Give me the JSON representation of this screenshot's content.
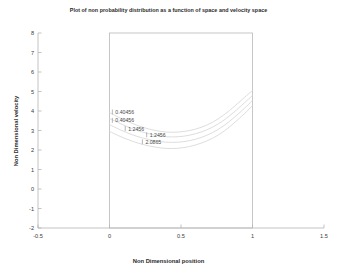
{
  "chart_data": {
    "type": "line",
    "title": "Plot of non probability distribution as a function of space and velocity space",
    "xlabel": "Non Dimensional position",
    "ylabel": "Non Dimensional velocity",
    "xlim": [
      -0.5,
      1.5
    ],
    "ylim": [
      -2,
      8
    ],
    "xticks": [
      "-0.5",
      "0",
      "0.5",
      "1",
      "1.5"
    ],
    "xtick_values": [
      -0.5,
      0,
      0.5,
      1,
      1.5
    ],
    "yticks": [
      "8",
      "7",
      "6",
      "5",
      "4",
      "3",
      "2",
      "1",
      "0",
      "-1",
      "-2"
    ],
    "ytick_values": [
      8,
      7,
      6,
      5,
      4,
      3,
      2,
      1,
      0,
      -1,
      -2
    ],
    "grid": false,
    "legend": "none",
    "data_box": {
      "x_range": [
        0,
        1
      ],
      "y_range": [
        -2,
        8
      ]
    },
    "series": [
      {
        "name": "0.40456",
        "level": 0.40456,
        "x": [
          0.0,
          0.08,
          0.16,
          0.24,
          0.32,
          0.4,
          0.48,
          0.56,
          0.64,
          0.72,
          0.8,
          0.88,
          0.96,
          1.0
        ],
        "y": [
          3.92,
          3.62,
          3.36,
          3.15,
          3.0,
          2.92,
          2.92,
          3.0,
          3.16,
          3.42,
          3.8,
          4.28,
          4.8,
          5.05
        ]
      },
      {
        "name": "0.40456",
        "level": 0.40456,
        "x": [
          0.0,
          0.08,
          0.16,
          0.24,
          0.32,
          0.4,
          0.48,
          0.56,
          0.64,
          0.72,
          0.8,
          0.88,
          0.96,
          1.0
        ],
        "y": [
          3.62,
          3.34,
          3.09,
          2.9,
          2.76,
          2.68,
          2.68,
          2.76,
          2.92,
          3.17,
          3.53,
          4.0,
          4.53,
          4.8
        ]
      },
      {
        "name": "1.2456",
        "level": 1.2456,
        "x": [
          0.0,
          0.08,
          0.16,
          0.24,
          0.32,
          0.4,
          0.48,
          0.56,
          0.64,
          0.72,
          0.8,
          0.88,
          0.96,
          1.0
        ],
        "y": [
          3.3,
          3.02,
          2.78,
          2.6,
          2.47,
          2.4,
          2.4,
          2.48,
          2.64,
          2.89,
          3.25,
          3.72,
          4.25,
          4.55
        ]
      },
      {
        "name": "2.0865",
        "level": 2.0865,
        "x": [
          0.0,
          0.08,
          0.16,
          0.24,
          0.32,
          0.4,
          0.48,
          0.56,
          0.64,
          0.72,
          0.8,
          0.88,
          0.96,
          1.0
        ],
        "y": [
          2.95,
          2.68,
          2.45,
          2.27,
          2.15,
          2.08,
          2.09,
          2.18,
          2.35,
          2.6,
          2.96,
          3.44,
          3.98,
          4.28
        ]
      }
    ],
    "contour_labels": [
      {
        "text": "0.40456",
        "x": 0.02,
        "y": 3.95
      },
      {
        "text": "0.40456",
        "x": 0.02,
        "y": 3.52
      },
      {
        "text": "1.2456",
        "x": 0.11,
        "y": 3.1
      },
      {
        "text": "1.2456",
        "x": 0.26,
        "y": 2.78
      },
      {
        "text": "2.0865",
        "x": 0.23,
        "y": 2.42
      }
    ]
  },
  "colors": {
    "curve": "#d2d2d2",
    "axis": "#b4b4b4",
    "box": "#b8b8b8",
    "text": "#2b2b2b",
    "tick_text": "#3a3a3a",
    "background": "#ffffff"
  }
}
